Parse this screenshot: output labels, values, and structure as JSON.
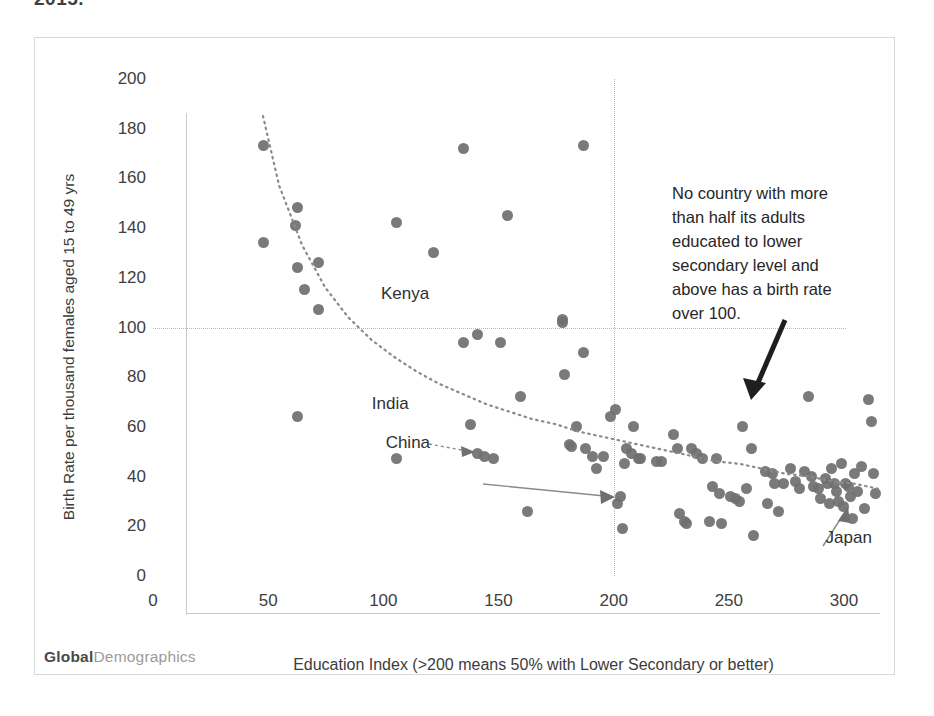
{
  "clipped_title": "2015.",
  "watermark": {
    "bold": "Global",
    "light": "Demographics"
  },
  "annotation": {
    "lines": [
      "No country with  more",
      "than half its adults",
      "educated  to  lower",
      "secondary level and",
      "above has a birth rate",
      "over 100."
    ],
    "text": "No country with more than half its adults educated to lower secondary level and above has a birth rate over 100."
  },
  "series_labels": [
    {
      "name": "Kenya",
      "label": "Kenya"
    },
    {
      "name": "India",
      "label": "India"
    },
    {
      "name": "China",
      "label": "China"
    },
    {
      "name": "Japan",
      "label": "Japan"
    }
  ],
  "chart_data": {
    "type": "scatter",
    "title": "",
    "xlabel": "Education Index (>200 means 50% with Lower Secondary or better)",
    "ylabel": "Birth Rate per thousand females aged 15 to 49 yrs",
    "xlim": [
      0,
      300
    ],
    "ylim": [
      0,
      200
    ],
    "xticks": [
      0,
      50,
      100,
      150,
      200,
      250,
      300
    ],
    "yticks": [
      0,
      20,
      40,
      60,
      80,
      100,
      120,
      140,
      160,
      180,
      200
    ],
    "grid": "reference lines only: horizontal at y=100, vertical at x=200",
    "reference_lines": {
      "horizontal_y": 100,
      "vertical_x": 200
    },
    "legend": "none",
    "trendline": {
      "type": "power",
      "description": "dotted decreasing power-curve fit",
      "points": [
        [
          33,
          200
        ],
        [
          40,
          172
        ],
        [
          50,
          148
        ],
        [
          60,
          131
        ],
        [
          70,
          119
        ],
        [
          80,
          110
        ],
        [
          90,
          103
        ],
        [
          100,
          97
        ],
        [
          110,
          92
        ],
        [
          120,
          88
        ],
        [
          130,
          84
        ],
        [
          140,
          81
        ],
        [
          150,
          78
        ],
        [
          160,
          76
        ],
        [
          170,
          73
        ],
        [
          180,
          71
        ],
        [
          190,
          69
        ],
        [
          200,
          67
        ],
        [
          210,
          65
        ],
        [
          220,
          63
        ],
        [
          230,
          61
        ],
        [
          240,
          60
        ],
        [
          250,
          58
        ],
        [
          260,
          56
        ],
        [
          270,
          55
        ],
        [
          280,
          53
        ],
        [
          290,
          52
        ],
        [
          300,
          50
        ]
      ]
    },
    "annotations": [
      {
        "name": "Kenya",
        "x": 120,
        "y": 109,
        "label_x": 99,
        "label_y": 113
      },
      {
        "name": "India",
        "x": 133,
        "y": 63,
        "label_x": 95,
        "label_y": 69
      },
      {
        "name": "China",
        "x": 188,
        "y": 47,
        "label_x": 101,
        "label_y": 53
      },
      {
        "name": "Japan",
        "x": 285,
        "y": 43,
        "label_x": 292,
        "label_y": 15
      }
    ],
    "points": [
      [
        33,
        188
      ],
      [
        33,
        149
      ],
      [
        48,
        163
      ],
      [
        47,
        156
      ],
      [
        48,
        139
      ],
      [
        51,
        130
      ],
      [
        48,
        79
      ],
      [
        57,
        141
      ],
      [
        57,
        122
      ],
      [
        91,
        62
      ],
      [
        91,
        157
      ],
      [
        107,
        145
      ],
      [
        120,
        187
      ],
      [
        120,
        109
      ],
      [
        123,
        76
      ],
      [
        126,
        112
      ],
      [
        126,
        64
      ],
      [
        129,
        63
      ],
      [
        133,
        62
      ],
      [
        136,
        109
      ],
      [
        139,
        160
      ],
      [
        145,
        87
      ],
      [
        148,
        41
      ],
      [
        163,
        118
      ],
      [
        163,
        117
      ],
      [
        164,
        96
      ],
      [
        166,
        68
      ],
      [
        167,
        67
      ],
      [
        169,
        75
      ],
      [
        172,
        188
      ],
      [
        172,
        105
      ],
      [
        173,
        66
      ],
      [
        176,
        63
      ],
      [
        178,
        58
      ],
      [
        181,
        63
      ],
      [
        184,
        79
      ],
      [
        186,
        82
      ],
      [
        187,
        44
      ],
      [
        188,
        47
      ],
      [
        189,
        34
      ],
      [
        190,
        60
      ],
      [
        191,
        66
      ],
      [
        193,
        64
      ],
      [
        194,
        75
      ],
      [
        196,
        62
      ],
      [
        197,
        62
      ],
      [
        204,
        61
      ],
      [
        206,
        61
      ],
      [
        211,
        72
      ],
      [
        213,
        66
      ],
      [
        214,
        40
      ],
      [
        216,
        37
      ],
      [
        217,
        36
      ],
      [
        219,
        66
      ],
      [
        221,
        64
      ],
      [
        224,
        62
      ],
      [
        227,
        37
      ],
      [
        228,
        51
      ],
      [
        230,
        62
      ],
      [
        231,
        48
      ],
      [
        232,
        36
      ],
      [
        236,
        47
      ],
      [
        238,
        46
      ],
      [
        240,
        45
      ],
      [
        241,
        75
      ],
      [
        243,
        50
      ],
      [
        245,
        66
      ],
      [
        246,
        31
      ],
      [
        251,
        57
      ],
      [
        252,
        44
      ],
      [
        254,
        56
      ],
      [
        255,
        52
      ],
      [
        257,
        41
      ],
      [
        259,
        52
      ],
      [
        262,
        58
      ],
      [
        264,
        53
      ],
      [
        266,
        50
      ],
      [
        268,
        57
      ],
      [
        270,
        87
      ],
      [
        271,
        55
      ],
      [
        272,
        51
      ],
      [
        274,
        50
      ],
      [
        275,
        46
      ],
      [
        277,
        54
      ],
      [
        278,
        52
      ],
      [
        279,
        44
      ],
      [
        280,
        58
      ],
      [
        281,
        52
      ],
      [
        282,
        49
      ],
      [
        283,
        45
      ],
      [
        284,
        60
      ],
      [
        285,
        43
      ],
      [
        286,
        52
      ],
      [
        287,
        51
      ],
      [
        288,
        47
      ],
      [
        289,
        38
      ],
      [
        290,
        56
      ],
      [
        291,
        49
      ],
      [
        293,
        59
      ],
      [
        294,
        42
      ],
      [
        296,
        86
      ],
      [
        297,
        77
      ],
      [
        298,
        56
      ],
      [
        299,
        48
      ]
    ]
  }
}
